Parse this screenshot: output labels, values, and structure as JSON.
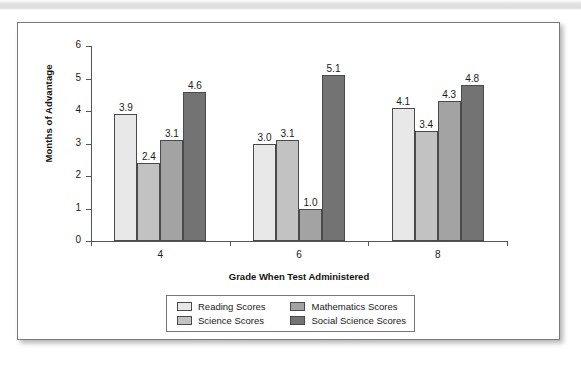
{
  "figure": {
    "frame_border_color": "#7a7a7a",
    "background_color": "#ffffff"
  },
  "chart_data": {
    "type": "bar",
    "title": "",
    "subtitle": "",
    "xlabel": "Grade When Test Administered",
    "ylabel": "Months of Advantage",
    "categories": [
      "4",
      "6",
      "8"
    ],
    "ylim": [
      0,
      6
    ],
    "yticks": [
      "0",
      "1",
      "2",
      "3",
      "4",
      "5",
      "6"
    ],
    "grid": false,
    "legend_position": "bottom",
    "series": [
      {
        "name": "Reading Scores",
        "color": "#e8e8e8",
        "values": [
          3.9,
          3.0,
          4.1
        ],
        "labels": [
          "3.9",
          "3.0",
          "4.1"
        ]
      },
      {
        "name": "Science Scores",
        "color": "#c2c2c2",
        "values": [
          2.4,
          3.1,
          3.4
        ],
        "labels": [
          "2.4",
          "3.1",
          "3.4"
        ]
      },
      {
        "name": "Mathematics Scores",
        "color": "#a3a3a3",
        "values": [
          3.1,
          1.0,
          4.3
        ],
        "labels": [
          "3.1",
          "1.0",
          "4.3"
        ]
      },
      {
        "name": "Social Science Scores",
        "color": "#737373",
        "values": [
          4.6,
          5.1,
          4.8
        ],
        "labels": [
          "4.6",
          "5.1",
          "4.8"
        ]
      }
    ],
    "legend_order": [
      "Reading Scores",
      "Mathematics Scores",
      "Science Scores",
      "Social Science Scores"
    ]
  }
}
